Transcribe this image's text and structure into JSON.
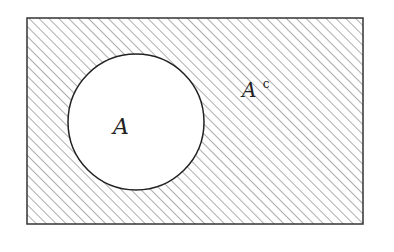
{
  "diagram": {
    "type": "venn",
    "title": "",
    "universe": {
      "x": 27,
      "y": 18,
      "width": 336,
      "height": 206,
      "stroke": "#333333",
      "hatch_color": "#8a8a8a",
      "hatch_spacing": 7
    },
    "set": {
      "cx": 136,
      "cy": 122,
      "r": 68,
      "fill": "#ffffff",
      "stroke": "#222222"
    },
    "labels": {
      "set": "A",
      "complement_base": "A",
      "complement_sup": "c"
    },
    "shaded_region": "complement of A"
  }
}
